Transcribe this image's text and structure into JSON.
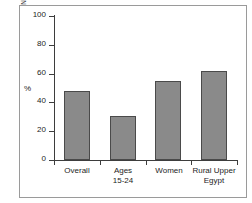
{
  "source_note": "Source: Human Development Report 1998/9 (INP/UNDP)",
  "chart_data": {
    "type": "bar",
    "title": "",
    "xlabel": "",
    "ylabel": "%",
    "categories": [
      "Overall",
      "Ages\n15-24",
      "Women",
      "Rural Upper\nEgypt"
    ],
    "values": [
      48,
      30.5,
      55,
      62
    ],
    "ylim": [
      0,
      100
    ],
    "yticks": [
      0,
      20,
      40,
      60,
      80,
      100
    ],
    "ytick_labels": [
      "0",
      "20",
      "40",
      "60",
      "80",
      "100"
    ],
    "grid": false,
    "legend": null,
    "bar_color": "#8a8a8a",
    "bar_edge_color": "#4a4a4a",
    "axis_color": "#3d3d3d",
    "frame_color": "#9a9a9a",
    "background": "#ffffff"
  }
}
